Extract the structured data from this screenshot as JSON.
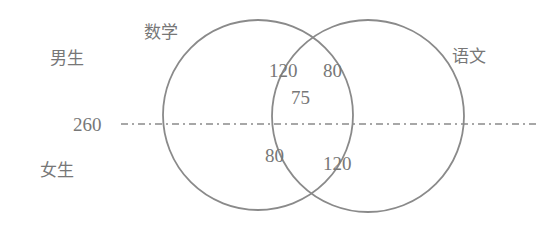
{
  "diagram": {
    "type": "venn",
    "sets": [
      {
        "name": "数学",
        "label": "数学"
      },
      {
        "name": "语文",
        "label": "语文"
      }
    ],
    "row_labels": {
      "top": "男生",
      "bottom": "女生"
    },
    "divider_label": "260",
    "regions": {
      "math_only_boys": "",
      "intersection_boys_left": "120",
      "intersection_boys_right": "80",
      "intersection_center": "75",
      "intersection_girls_left": "80",
      "intersection_girls_right": "120"
    },
    "colors": {
      "stroke": "#8a8a8a",
      "text": "#777777"
    }
  }
}
